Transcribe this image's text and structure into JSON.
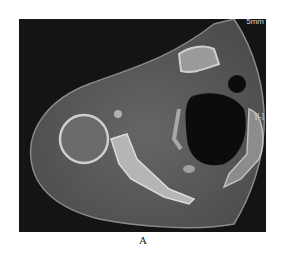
{
  "figure": {
    "panel_label": "A",
    "overlays": {
      "slice_thickness": "5mm",
      "side_marker": "[L]"
    },
    "colors": {
      "background": "#141414",
      "soft_tissue": "#5a5a5a",
      "bone": "#c8c8c8",
      "air": "#0c0c0c"
    }
  }
}
